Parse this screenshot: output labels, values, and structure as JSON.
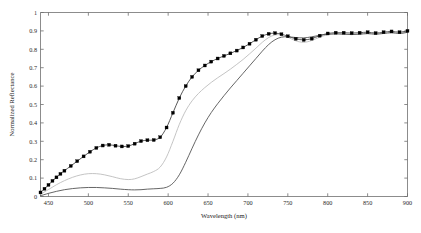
{
  "chart_data": {
    "type": "line",
    "title": "",
    "xlabel": "Wavelength (nm)",
    "ylabel": "Normalized Reflectance",
    "xlim": [
      440,
      900
    ],
    "ylim": [
      0,
      1
    ],
    "grid": false,
    "legend": false,
    "xticks": [
      450,
      500,
      550,
      600,
      650,
      700,
      750,
      800,
      850,
      900
    ],
    "xticklabels": [
      "450",
      "500",
      "550",
      "600",
      "650",
      "700",
      "750",
      "800",
      "850",
      "900"
    ],
    "yticks": [
      0,
      0.1,
      0.2,
      0.3,
      0.4,
      0.5,
      0.6,
      0.7,
      0.8,
      0.9,
      1
    ],
    "yticklabels": [
      "0",
      "0.1",
      "0.2",
      "0.3",
      "0.4",
      "0.5",
      "0.6",
      "0.7",
      "0.8",
      "0.9",
      "1"
    ],
    "series": [
      {
        "name": "markered-curve",
        "color": "#3a3a3a",
        "marker": "square-filled",
        "marker_color": "#000000",
        "x": [
          440,
          445,
          450,
          455,
          460,
          465,
          470,
          478,
          486,
          494,
          502,
          510,
          518,
          526,
          534,
          542,
          550,
          558,
          566,
          574,
          582,
          590,
          598,
          606,
          614,
          622,
          630,
          638,
          646,
          654,
          662,
          670,
          678,
          686,
          694,
          702,
          710,
          718,
          726,
          734,
          742,
          750,
          760,
          770,
          780,
          790,
          800,
          810,
          820,
          830,
          840,
          850,
          860,
          870,
          880,
          890,
          900
        ],
        "y": [
          0.022,
          0.042,
          0.063,
          0.085,
          0.104,
          0.123,
          0.14,
          0.166,
          0.192,
          0.218,
          0.243,
          0.264,
          0.277,
          0.281,
          0.276,
          0.272,
          0.274,
          0.287,
          0.301,
          0.306,
          0.307,
          0.322,
          0.375,
          0.455,
          0.535,
          0.6,
          0.65,
          0.686,
          0.712,
          0.733,
          0.75,
          0.764,
          0.778,
          0.793,
          0.81,
          0.83,
          0.852,
          0.872,
          0.884,
          0.888,
          0.882,
          0.871,
          0.857,
          0.851,
          0.858,
          0.874,
          0.886,
          0.89,
          0.89,
          0.888,
          0.89,
          0.893,
          0.888,
          0.893,
          0.897,
          0.893,
          0.9
        ]
      },
      {
        "name": "light-gray-curve",
        "color": "#b9b9b9",
        "marker": "none",
        "x": [
          440,
          450,
          460,
          470,
          480,
          490,
          500,
          510,
          520,
          530,
          540,
          550,
          558,
          566,
          574,
          582,
          590,
          598,
          606,
          614,
          622,
          630,
          638,
          646,
          654,
          662,
          670,
          678,
          686,
          694,
          702,
          710,
          718,
          726,
          734,
          742,
          750,
          760,
          770,
          780,
          790,
          800,
          810,
          820,
          830,
          840,
          850,
          860,
          870,
          880,
          890,
          900
        ],
        "y": [
          0.012,
          0.038,
          0.064,
          0.086,
          0.104,
          0.117,
          0.124,
          0.124,
          0.118,
          0.108,
          0.097,
          0.092,
          0.096,
          0.108,
          0.122,
          0.136,
          0.16,
          0.215,
          0.3,
          0.392,
          0.466,
          0.52,
          0.56,
          0.592,
          0.62,
          0.645,
          0.668,
          0.692,
          0.718,
          0.745,
          0.775,
          0.806,
          0.838,
          0.864,
          0.878,
          0.878,
          0.866,
          0.846,
          0.838,
          0.848,
          0.866,
          0.879,
          0.884,
          0.884,
          0.882,
          0.884,
          0.887,
          0.884,
          0.888,
          0.892,
          0.888,
          0.894
        ]
      },
      {
        "name": "dark-gray-curve",
        "color": "#4a4a4a",
        "marker": "none",
        "x": [
          440,
          450,
          460,
          470,
          480,
          490,
          500,
          510,
          520,
          530,
          540,
          550,
          558,
          566,
          574,
          582,
          590,
          598,
          606,
          614,
          622,
          630,
          638,
          646,
          654,
          662,
          670,
          678,
          686,
          694,
          702,
          710,
          718,
          726,
          734,
          742,
          750,
          760,
          770,
          780,
          790,
          800,
          810,
          820,
          830,
          840,
          850,
          860,
          870,
          880,
          890,
          900
        ],
        "y": [
          0.004,
          0.017,
          0.028,
          0.037,
          0.043,
          0.047,
          0.049,
          0.049,
          0.047,
          0.044,
          0.04,
          0.037,
          0.036,
          0.037,
          0.04,
          0.042,
          0.044,
          0.05,
          0.072,
          0.118,
          0.186,
          0.262,
          0.335,
          0.4,
          0.456,
          0.504,
          0.548,
          0.59,
          0.63,
          0.67,
          0.71,
          0.75,
          0.79,
          0.826,
          0.852,
          0.866,
          0.868,
          0.864,
          0.862,
          0.868,
          0.876,
          0.882,
          0.884,
          0.882,
          0.88,
          0.882,
          0.885,
          0.882,
          0.886,
          0.89,
          0.886,
          0.892
        ]
      }
    ]
  }
}
